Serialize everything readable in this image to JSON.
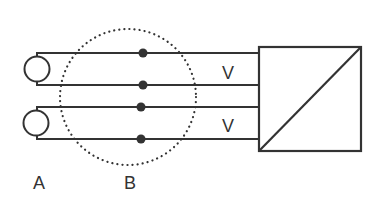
{
  "diagram": {
    "labels": {
      "a": "A",
      "b": "B",
      "v_top": "V",
      "v_bottom": "V"
    },
    "colors": {
      "stroke": "#333333",
      "background": "#ffffff"
    },
    "elements": {
      "sources": [
        {
          "name": "source-top",
          "symbol": "circle"
        },
        {
          "name": "source-bottom",
          "symbol": "circle"
        }
      ],
      "wires": 4,
      "junction_dots": 4,
      "region_b": "dotted-circle",
      "converter": "square-with-diagonal"
    }
  }
}
